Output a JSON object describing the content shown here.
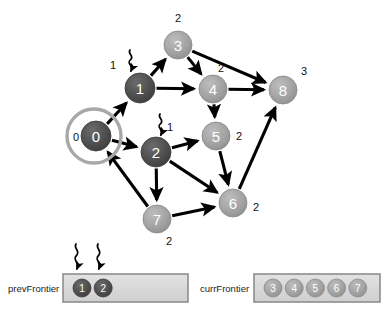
{
  "diagram": {
    "colors": {
      "visited_dark": "#4a4a4a",
      "frontier_gray": "#9d9d9d",
      "edge_black": "#000000",
      "ring_gray": "#a8a8a8",
      "box_fill": "#d8d8d8",
      "box_border": "#8e8e8e",
      "text_dark": "#111111"
    },
    "nodes": [
      {
        "id": "0",
        "label": "0",
        "x": 96,
        "y": 136,
        "r": 15,
        "shade": "dark",
        "dist": "0",
        "dist_x": 76,
        "dist_y": 137,
        "ringed": true
      },
      {
        "id": "1",
        "label": "1",
        "x": 140,
        "y": 88,
        "r": 15,
        "shade": "dark",
        "dist": "1",
        "dist_x": 113,
        "dist_y": 65,
        "ringed": false
      },
      {
        "id": "2",
        "label": "2",
        "x": 156,
        "y": 152,
        "r": 15,
        "shade": "dark",
        "dist": "1",
        "dist_x": 170,
        "dist_y": 127,
        "ringed": false
      },
      {
        "id": "3",
        "label": "3",
        "x": 178,
        "y": 45,
        "r": 14,
        "shade": "light",
        "dist": "2",
        "dist_x": 178,
        "dist_y": 18,
        "ringed": false
      },
      {
        "id": "4",
        "label": "4",
        "x": 213,
        "y": 89,
        "r": 14,
        "shade": "light",
        "dist": "2",
        "dist_x": 221,
        "dist_y": 68,
        "ringed": false
      },
      {
        "id": "5",
        "label": "5",
        "x": 216,
        "y": 136,
        "r": 14,
        "shade": "light",
        "dist": "2",
        "dist_x": 239,
        "dist_y": 136,
        "ringed": false
      },
      {
        "id": "6",
        "label": "6",
        "x": 233,
        "y": 203,
        "r": 14,
        "shade": "light",
        "dist": "2",
        "dist_x": 256,
        "dist_y": 207,
        "ringed": false
      },
      {
        "id": "7",
        "label": "7",
        "x": 157,
        "y": 219,
        "r": 14,
        "shade": "light",
        "dist": "2",
        "dist_x": 169,
        "dist_y": 241,
        "ringed": false
      },
      {
        "id": "8",
        "label": "8",
        "x": 283,
        "y": 90,
        "r": 14,
        "shade": "light",
        "dist": "3",
        "dist_x": 304,
        "dist_y": 71,
        "ringed": false
      }
    ],
    "edges": [
      {
        "from": "0",
        "to": "1"
      },
      {
        "from": "0",
        "to": "2"
      },
      {
        "from": "1",
        "to": "3"
      },
      {
        "from": "1",
        "to": "4"
      },
      {
        "from": "3",
        "to": "4"
      },
      {
        "from": "3",
        "to": "8"
      },
      {
        "from": "4",
        "to": "8"
      },
      {
        "from": "4",
        "to": "5"
      },
      {
        "from": "2",
        "to": "5"
      },
      {
        "from": "2",
        "to": "6"
      },
      {
        "from": "2",
        "to": "7"
      },
      {
        "from": "5",
        "to": "6"
      },
      {
        "from": "7",
        "to": "6"
      },
      {
        "from": "7",
        "to": "0"
      },
      {
        "from": "6",
        "to": "8"
      }
    ],
    "squiggle_pointers": [
      {
        "target": "1",
        "x": 130,
        "y": 50,
        "len": 22
      },
      {
        "target": "2",
        "x": 160,
        "y": 114,
        "len": 22
      },
      {
        "target": "prevFrontier-slot-1",
        "x": 76,
        "y": 244,
        "len": 26
      },
      {
        "target": "prevFrontier-slot-2",
        "x": 98,
        "y": 244,
        "len": 26
      }
    ]
  },
  "frontiers": {
    "prev": {
      "name": "prevFrontier",
      "name_x": 8,
      "name_y": 288,
      "box": {
        "x": 63,
        "y": 274,
        "w": 125,
        "h": 28
      },
      "items": [
        "1",
        "2"
      ],
      "item_shade": "dark"
    },
    "curr": {
      "name": "currFrontier",
      "name_x": 200,
      "name_y": 288,
      "box": {
        "x": 254,
        "y": 274,
        "w": 126,
        "h": 28
      },
      "items": [
        "3",
        "4",
        "5",
        "6",
        "7"
      ],
      "item_shade": "light"
    }
  }
}
